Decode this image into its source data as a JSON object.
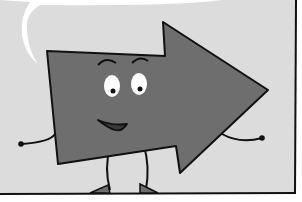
{
  "image": {
    "description": "Grayscale cartoon of a smiling right-pointing arrow character with eyes, eyebrows, mouth, arms and legs, inside a comic panel with a speech bubble edge at top-left",
    "colors": {
      "panel_background": "#dcdcdc",
      "arrow_fill": "#6e6e6e",
      "outline": "#111111",
      "eye_white": "#ffffff",
      "mouth_fill": "#3a3a3a",
      "bubble_white": "#ffffff"
    },
    "character": {
      "shape": "arrow",
      "direction": "right",
      "expression": "smiling"
    }
  }
}
